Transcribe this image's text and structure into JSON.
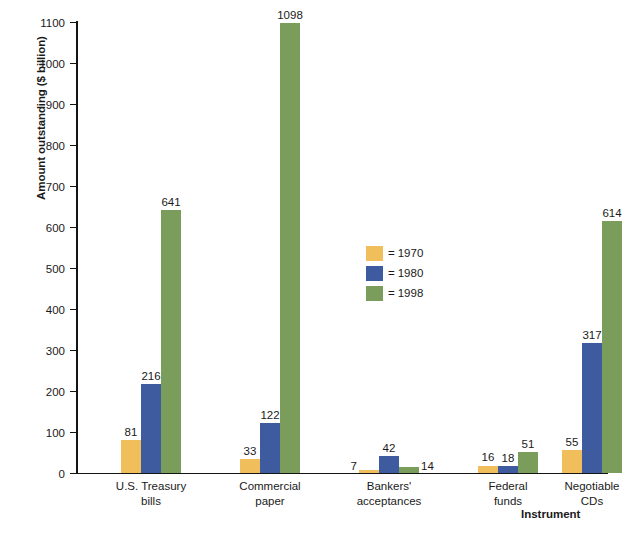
{
  "chart_data": {
    "type": "bar",
    "title": "",
    "xlabel": "Instrument",
    "ylabel": "Amount outstanding ($ billion)",
    "ylim": [
      0,
      1100
    ],
    "ytick_step": 100,
    "yticks": [
      0,
      100,
      200,
      300,
      400,
      500,
      600,
      700,
      800,
      900,
      1000,
      1100
    ],
    "grid": false,
    "legend_position": "center",
    "categories": [
      "U.S. Treasury bills",
      "Commercial paper",
      "Bankers' acceptances",
      "Federal funds",
      "Negotiable CDs"
    ],
    "category_lines": [
      [
        "U.S. Treasury",
        "bills"
      ],
      [
        "Commercial",
        "paper"
      ],
      [
        "Bankers'",
        "acceptances"
      ],
      [
        "Federal",
        "funds"
      ],
      [
        "Negotiable",
        "CDs"
      ]
    ],
    "series": [
      {
        "name": "1970",
        "color": "#f0bf5c",
        "values": [
          81,
          33,
          7,
          16,
          55
        ]
      },
      {
        "name": "1980",
        "color": "#3f5ba0",
        "values": [
          216,
          122,
          42,
          18,
          317
        ]
      },
      {
        "name": "1998",
        "color": "#7b9d5c",
        "values": [
          641,
          1098,
          14,
          51,
          614
        ]
      }
    ]
  },
  "legend": {
    "equals": "=",
    "entries": [
      {
        "label": "1970",
        "color": "#f0bf5c"
      },
      {
        "label": "1980",
        "color": "#3f5ba0"
      },
      {
        "label": "1998",
        "color": "#7b9d5c"
      }
    ]
  },
  "axes": {
    "y_title": "Amount outstanding ($ billion)",
    "x_title": "Instrument",
    "y_tick_labels": [
      "1100",
      "1000",
      "900",
      "800",
      "700",
      "600",
      "500",
      "400",
      "300",
      "200",
      "100",
      "0"
    ]
  },
  "bar_labels": {
    "treasury": {
      "y1970": "81",
      "y1980": "216",
      "y1998": "641"
    },
    "commercial": {
      "y1970": "33",
      "y1980": "122",
      "y1998": "1098"
    },
    "bankers": {
      "y1970": "7",
      "y1980": "42",
      "y1998": "14"
    },
    "federal": {
      "y1970": "16",
      "y1980": "18",
      "y1998": "51"
    },
    "cds": {
      "y1970": "55",
      "y1980": "317",
      "y1998": "614"
    }
  }
}
